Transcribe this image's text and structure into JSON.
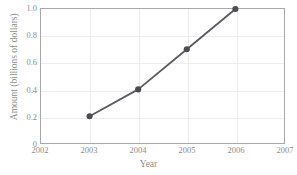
{
  "chart_data": {
    "type": "line",
    "title": "",
    "xlabel": "Year",
    "ylabel": "Amount (billions of dollars)",
    "xlim": [
      2002,
      2007
    ],
    "ylim": [
      0,
      1.0
    ],
    "grid": true,
    "legend": "none",
    "x": [
      2003,
      2004,
      2005,
      2006
    ],
    "values": [
      0.2,
      0.4,
      0.7,
      1.0
    ],
    "series": [
      {
        "name": "Amount",
        "x": [
          2003,
          2004,
          2005,
          2006
        ],
        "values": [
          0.2,
          0.4,
          0.7,
          1.0
        ],
        "color": "#5a5a63",
        "marker": "circle"
      }
    ],
    "xticks": [
      {
        "value": 2002,
        "label": "2002"
      },
      {
        "value": 2003,
        "label": "2003"
      },
      {
        "value": 2004,
        "label": "2004"
      },
      {
        "value": 2005,
        "label": "2005"
      },
      {
        "value": 2006,
        "label": "2006"
      },
      {
        "value": 2007,
        "label": "2007"
      }
    ],
    "yticks": [
      {
        "value": 0,
        "label": "0"
      },
      {
        "value": 0.2,
        "label": "0.2"
      },
      {
        "value": 0.4,
        "label": "0.4"
      },
      {
        "value": 0.6,
        "label": "0.6"
      },
      {
        "value": 0.8,
        "label": "0.8"
      },
      {
        "value": 1.0,
        "label": "1.0"
      }
    ],
    "colors": {
      "line": "#5a5a63",
      "marker": "#4c4c55",
      "grid": "#ededed",
      "frame": "#a8a8a8",
      "text": "#8d8d8d",
      "background": "#ffffff"
    }
  }
}
